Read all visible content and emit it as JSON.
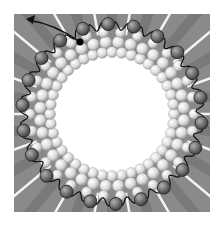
{
  "figure": {
    "colors": {
      "background": "#ffffff",
      "spoke_dark": "#7a7a7a",
      "spoke_light": "#b8b8b8",
      "inner_sphere": "#e8e8e8",
      "outer_bead": "#6e6e6e",
      "line": "#111111"
    },
    "ring": {
      "cx": 112,
      "cy": 114,
      "inner_radius": 55,
      "outer_radius": 92
    },
    "bead_count": 22,
    "spoke_count": 18,
    "arrow": {
      "from": [
        80,
        42
      ],
      "to": [
        27,
        20
      ],
      "dot": [
        80,
        42
      ]
    }
  }
}
